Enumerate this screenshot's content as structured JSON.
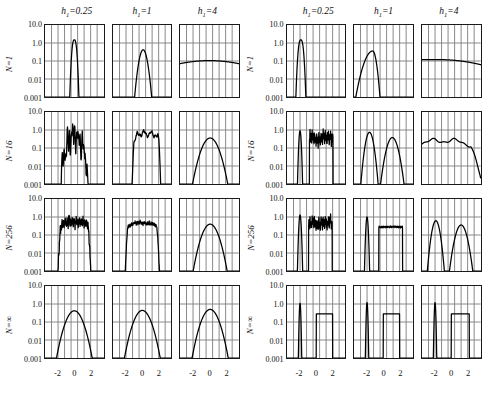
{
  "figure": {
    "type": "multi-panel-log-plot-grid",
    "groups": 2,
    "rows": 4,
    "cols": 3
  },
  "axes": {
    "y_ticks": [
      "10.0",
      "1.0",
      "0.1",
      "0.01",
      "0.001"
    ],
    "y_tick_values": [
      10,
      1,
      0.1,
      0.01,
      0.001
    ],
    "y_scale": "log",
    "y_range": [
      0.001,
      10
    ],
    "x_ticks": [
      "-2",
      "0",
      "2"
    ],
    "x_tick_values": [
      -2,
      0,
      2
    ],
    "x_range": [
      -3.6,
      3.6
    ],
    "x_minor_gridlines": 8,
    "grid": true,
    "grid_color": "#7d7d7d",
    "axis_color": "#1a1a1a",
    "curve_color": "#000000"
  },
  "row_labels": [
    "N=1",
    "N=16",
    "N=256",
    "N=∞"
  ],
  "col_headers": [
    {
      "label": "h",
      "sub": "1",
      "eq": "=0.25"
    },
    {
      "label": "h",
      "sub": "1",
      "eq": "=1"
    },
    {
      "label": "h",
      "sub": "1",
      "eq": "=4"
    }
  ],
  "chart_data": [
    {
      "type": "line",
      "group": "left",
      "title": "",
      "xlabel": "",
      "ylabel": "",
      "ylim": [
        0.001,
        10
      ],
      "xlim": [
        -3.6,
        3.6
      ],
      "panels": [
        {
          "row": "N=1",
          "col": "h1=0.25",
          "shape": "narrow-peak",
          "peak_x": 0.0,
          "peak_y": 1.5,
          "width": 0.55,
          "floor": 0.001
        },
        {
          "row": "N=1",
          "col": "h1=1",
          "shape": "broad-peak",
          "peak_x": 0.1,
          "peak_y": 0.42,
          "width": 2.2,
          "floor": 0.0015
        },
        {
          "row": "N=1",
          "col": "h1=4",
          "shape": "flat",
          "peak_x": 0.0,
          "peak_y": 0.105,
          "width": 7.0,
          "floor": 0.075
        },
        {
          "row": "N=16",
          "col": "h1=0.25",
          "shape": "oscillatory-narrow",
          "peak_x": 0.35,
          "peak_y": 0.85,
          "width": 1.6,
          "floor": 0.001,
          "noise": 0.95
        },
        {
          "row": "N=16",
          "col": "h1=1",
          "shape": "rough-plateau",
          "peak_x": 0.5,
          "peak_y": 0.62,
          "width": 3.0,
          "floor": 0.001,
          "noise": 0.35
        },
        {
          "row": "N=16",
          "col": "h1=4",
          "shape": "broad-peak",
          "peak_x": 0.1,
          "peak_y": 0.36,
          "width": 4.6,
          "floor": 0.016
        },
        {
          "row": "N=256",
          "col": "h1=0.25",
          "shape": "noisy-plateau",
          "peak_x": 0.0,
          "peak_y": 0.55,
          "width": 3.4,
          "floor": 0.0015,
          "noise": 0.8
        },
        {
          "row": "N=256",
          "col": "h1=1",
          "shape": "noisy-plateau",
          "peak_x": 0.0,
          "peak_y": 0.45,
          "width": 3.6,
          "floor": 0.004,
          "noise": 0.3
        },
        {
          "row": "N=256",
          "col": "h1=4",
          "shape": "broad-peak",
          "peak_x": 0.1,
          "peak_y": 0.4,
          "width": 4.4,
          "floor": 0.0018
        },
        {
          "row": "N=∞",
          "col": "h1=0.25",
          "shape": "parabola",
          "peak_x": 0.0,
          "peak_y": 0.42,
          "width": 4.6,
          "floor": 0.0016
        },
        {
          "row": "N=∞",
          "col": "h1=1",
          "shape": "parabola",
          "peak_x": 0.0,
          "peak_y": 0.44,
          "width": 4.6,
          "floor": 0.0016
        },
        {
          "row": "N=∞",
          "col": "h1=4",
          "shape": "parabola",
          "peak_x": 0.1,
          "peak_y": 0.5,
          "width": 4.6,
          "floor": 0.0016
        }
      ]
    },
    {
      "type": "line",
      "group": "right",
      "title": "",
      "xlabel": "",
      "ylabel": "",
      "ylim": [
        0.001,
        10
      ],
      "xlim": [
        -3.6,
        3.6
      ],
      "panels": [
        {
          "row": "N=1",
          "col": "h1=0.25",
          "shape": "narrow-peak-left",
          "peak_x": -1.9,
          "peak_y": 1.5,
          "width": 0.6,
          "floor": 0.001
        },
        {
          "row": "N=1",
          "col": "h1=1",
          "shape": "skew-peak",
          "peak_x": -1.3,
          "peak_y": 0.36,
          "width": 2.6,
          "floor": 0.0012
        },
        {
          "row": "N=1",
          "col": "h1=4",
          "shape": "decaying-flat",
          "peak_x": -2.5,
          "peak_y": 0.12,
          "width": 7.0,
          "floor": 0.042
        },
        {
          "row": "N=16",
          "col": "h1=0.25",
          "shape": "spike-plus-oscillatory",
          "spike_x": -2.0,
          "spike_y": 0.9,
          "band_x": 0.6,
          "band_y": 0.35,
          "floor": 0.001,
          "noise": 0.9
        },
        {
          "row": "N=16",
          "col": "h1=1",
          "shape": "two-lobes",
          "lobe1_x": -1.7,
          "lobe1_y": 0.75,
          "lobe2_x": 1.1,
          "lobe2_y": 0.38,
          "floor": 0.001
        },
        {
          "row": "N=16",
          "col": "h1=4",
          "shape": "wavy-plateau",
          "peak_x": -1.0,
          "peak_y": 0.25,
          "width": 6.0,
          "floor": 0.05
        },
        {
          "row": "N=256",
          "col": "h1=0.25",
          "shape": "spike-plus-noise-band",
          "spike_x": -2.0,
          "spike_y": 1.3,
          "band_x": 0.5,
          "band_y": 0.45,
          "floor": 0.001,
          "noise": 0.85
        },
        {
          "row": "N=256",
          "col": "h1=1",
          "shape": "spike-plus-flat-band",
          "spike_x": -2.0,
          "spike_y": 1.0,
          "band_x": 0.9,
          "band_y": 0.28,
          "floor": 0.001,
          "noise": 0.12
        },
        {
          "row": "N=256",
          "col": "h1=4",
          "shape": "two-lobes",
          "lobe1_x": -1.9,
          "lobe1_y": 0.62,
          "lobe2_x": 1.2,
          "lobe2_y": 0.36,
          "floor": 0.0015
        },
        {
          "row": "N=∞",
          "col": "h1=0.25",
          "shape": "spike-plus-box",
          "spike_x": -2.0,
          "spike_y": 1.1,
          "box_lo": 0.0,
          "box_hi": 2.0,
          "box_y": 0.28,
          "floor": 0.001
        },
        {
          "row": "N=∞",
          "col": "h1=1",
          "shape": "spike-plus-box",
          "spike_x": -2.0,
          "spike_y": 1.2,
          "box_lo": 0.0,
          "box_hi": 2.0,
          "box_y": 0.28,
          "floor": 0.001
        },
        {
          "row": "N=∞",
          "col": "h1=4",
          "shape": "spike-plus-box",
          "spike_x": -2.0,
          "spike_y": 1.2,
          "box_lo": 0.0,
          "box_hi": 2.2,
          "box_y": 0.28,
          "floor": 0.001
        }
      ]
    }
  ]
}
